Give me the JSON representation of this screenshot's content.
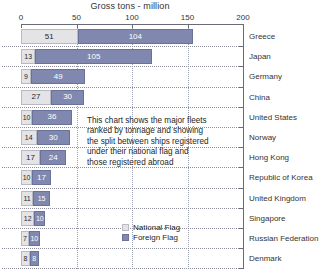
{
  "chart_data": {
    "type": "bar",
    "subtype": "horizontal-stacked",
    "title": "Gross tons - million",
    "xlabel": "Gross tons - million",
    "ylabel": "",
    "xlim": [
      0,
      200
    ],
    "xticks": [
      0,
      50,
      100,
      150,
      200
    ],
    "xticklabels": [
      "0",
      "50",
      "100",
      "150",
      "200"
    ],
    "grid": "vertical-dotted",
    "legend_position": "bottom-center",
    "categories": [
      "Greece",
      "Japan",
      "Germany",
      "China",
      "United States",
      "Norway",
      "Hong Kong",
      "Republic of Korea",
      "United Kingdom",
      "Singapore",
      "Russian Federation",
      "Denmark"
    ],
    "series": [
      {
        "name": "National Flag",
        "color": "#e4e4e6",
        "values": [
          51,
          13,
          9,
          27,
          10,
          14,
          17,
          10,
          11,
          12,
          7,
          8
        ]
      },
      {
        "name": "Foreign Flag",
        "color": "#8088b0",
        "values": [
          104,
          105,
          49,
          30,
          36,
          30,
          24,
          17,
          15,
          10,
          10,
          8
        ]
      }
    ],
    "totals": [
      155,
      118,
      58,
      57,
      46,
      44,
      41,
      27,
      26,
      22,
      17,
      16
    ],
    "annotation": "This chart shows the major fleets ranked by tonnage and showing the split between ships registered under their national flag and those registered abroad"
  },
  "annotation": {
    "lines": [
      "This chart shows the major fleets",
      "ranked by tonnage and showing",
      "the split between ships registered",
      "under their national flag and",
      "those registered abroad"
    ]
  },
  "legend": {
    "items": [
      {
        "label": "National Flag",
        "color": "#e4e4e6"
      },
      {
        "label": "Foreign Flag",
        "color": "#8088b0"
      }
    ]
  }
}
